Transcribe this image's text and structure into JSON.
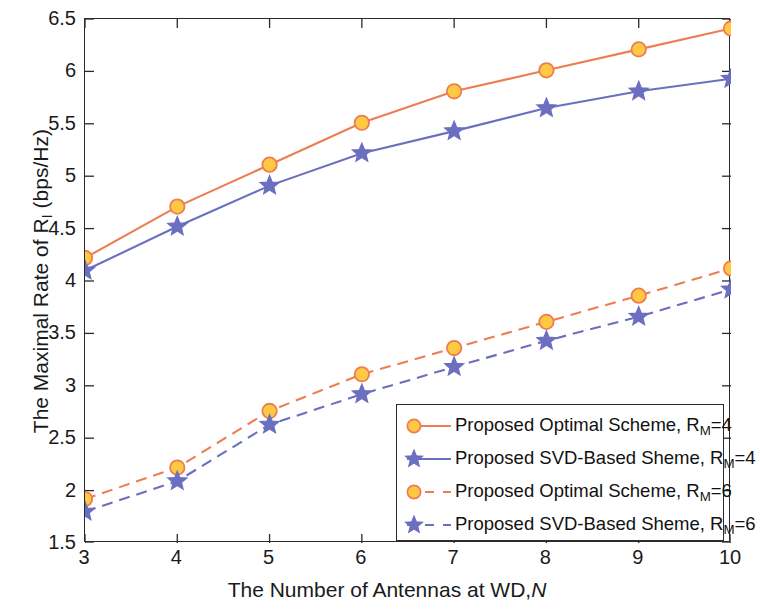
{
  "chart_data": {
    "type": "line",
    "title": "",
    "xlabel": "The Number of  Antennas at  WD,N",
    "ylabel": "The Maximal Rate of R_I (bps/Hz)",
    "x": [
      3,
      4,
      5,
      6,
      7,
      8,
      9,
      10
    ],
    "xlim": [
      3,
      10
    ],
    "ylim": [
      1.5,
      6.5
    ],
    "xticks": [
      "3",
      "4",
      "5",
      "6",
      "7",
      "8",
      "9",
      "10"
    ],
    "yticks": [
      "1.5",
      "2",
      "2.5",
      "3",
      "3.5",
      "4",
      "4.5",
      "5",
      "5.5",
      "6",
      "6.5"
    ],
    "grid": false,
    "legend_position": "lower right",
    "series": [
      {
        "name": "Proposed Optimal Scheme, R_M=4",
        "label_prefix": "Proposed Optimal Scheme, R",
        "label_sub": "M",
        "label_suffix": "=4",
        "color": "#ED7D52",
        "marker": "circle",
        "marker_face": "#FFC943",
        "linestyle": "solid",
        "values": [
          4.22,
          4.71,
          5.11,
          5.51,
          5.81,
          6.01,
          6.21,
          6.41
        ]
      },
      {
        "name": "Proposed SVD-Based Sheme, R_M=4",
        "label_prefix": "Proposed SVD-Based Sheme, R",
        "label_sub": "M",
        "label_suffix": "=4",
        "color": "#6B6FC0",
        "marker": "star",
        "marker_face": "#6B6FC0",
        "linestyle": "solid",
        "values": [
          4.1,
          4.52,
          4.91,
          5.22,
          5.43,
          5.65,
          5.81,
          5.93
        ]
      },
      {
        "name": "Proposed Optimal Scheme, R_M=6",
        "label_prefix": "Proposed Optimal Scheme, R",
        "label_sub": "M",
        "label_suffix": "=6",
        "color": "#ED7D52",
        "marker": "circle",
        "marker_face": "#FFC943",
        "linestyle": "dashed",
        "values": [
          1.92,
          2.22,
          2.76,
          3.11,
          3.36,
          3.61,
          3.86,
          4.12
        ]
      },
      {
        "name": "Proposed SVD-Based Sheme, R_M=6",
        "label_prefix": "Proposed SVD-Based Sheme, R",
        "label_sub": "M",
        "label_suffix": "=6",
        "color": "#6B6FC0",
        "marker": "star",
        "marker_face": "#6B6FC0",
        "linestyle": "dashed",
        "values": [
          1.8,
          2.09,
          2.63,
          2.92,
          3.18,
          3.43,
          3.66,
          3.92
        ]
      }
    ]
  },
  "axes": {
    "ylabel_prefix": "The Maximal Rate of R",
    "ylabel_sub": "I",
    "ylabel_suffix": " (bps/Hz)",
    "xlabel_main": "The Number of  Antennas at  WD,",
    "xlabel_italic": "N"
  }
}
